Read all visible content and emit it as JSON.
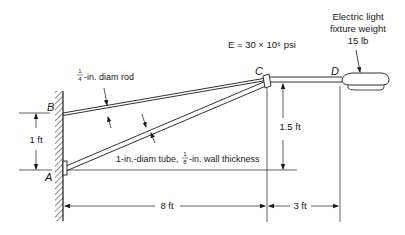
{
  "figure": {
    "points": {
      "A": "A",
      "B": "B",
      "C": "C",
      "D": "D"
    },
    "labels": {
      "modulus": "E = 30 × 10⁶ psi",
      "fixture_line1": "Electric light",
      "fixture_line2": "fixture weight",
      "fixture_line3": "15 lb",
      "rod_frac_num": "1",
      "rod_frac_den": "4",
      "rod_text": "-in. diam rod",
      "tube_text_a": "1-in.-diam tube,",
      "tube_frac_num": "1",
      "tube_frac_den": "8",
      "tube_text_b": "-in. wall thickness"
    },
    "dimensions": {
      "wall_height": "1 ft",
      "c_height": "1.5 ft",
      "span_ac": "8 ft",
      "span_cd": "3 ft"
    },
    "colors": {
      "ink": "#1a1a1a",
      "background": "#ffffff"
    }
  }
}
